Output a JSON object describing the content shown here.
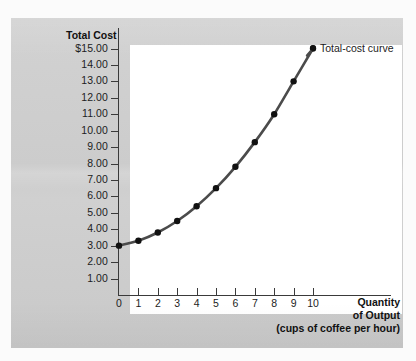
{
  "figure": {
    "y_axis_title": "Total Cost",
    "x_axis_title_line1": "Quantity",
    "x_axis_title_line2": "of Output",
    "x_axis_subtitle": "(cups of coffee per hour)",
    "legend_label": "Total-cost curve",
    "curve_color": "#4b4b4b",
    "point_color": "#111111",
    "panel_color": "#cfcfcf",
    "plot_color": "#ffffff"
  },
  "chart_data": {
    "type": "line",
    "title": "",
    "subtitle": "",
    "xlabel": "Quantity of Output (cups of coffee per hour)",
    "ylabel": "Total Cost",
    "xlim": [
      0,
      10
    ],
    "ylim": [
      0,
      15
    ],
    "grid": false,
    "legend_position": "inline-right-of-last-point",
    "x": [
      0,
      1,
      2,
      3,
      4,
      5,
      6,
      7,
      8,
      9,
      10
    ],
    "y": [
      3.0,
      3.3,
      3.8,
      4.5,
      5.4,
      6.5,
      7.8,
      9.3,
      11.0,
      13.0,
      15.0
    ],
    "series": [
      {
        "name": "Total-cost curve",
        "values": [
          3.0,
          3.3,
          3.8,
          4.5,
          5.4,
          6.5,
          7.8,
          9.3,
          11.0,
          13.0,
          15.0
        ]
      }
    ],
    "x_tick_labels": [
      "0",
      "1",
      "2",
      "3",
      "4",
      "5",
      "6",
      "7",
      "8",
      "9",
      "10"
    ],
    "y_tick_values": [
      15,
      14,
      13,
      12,
      11,
      10,
      9,
      8,
      7,
      6,
      5,
      4,
      3,
      2,
      1
    ],
    "y_tick_labels": [
      "$15.00",
      "14.00",
      "13.00",
      "12.00",
      "11.00",
      "10.00",
      "9.00",
      "8.00",
      "7.00",
      "6.00",
      "5.00",
      "4.00",
      "3.00",
      "2.00",
      "1.00"
    ],
    "annotations": [
      "Total-cost curve"
    ]
  }
}
